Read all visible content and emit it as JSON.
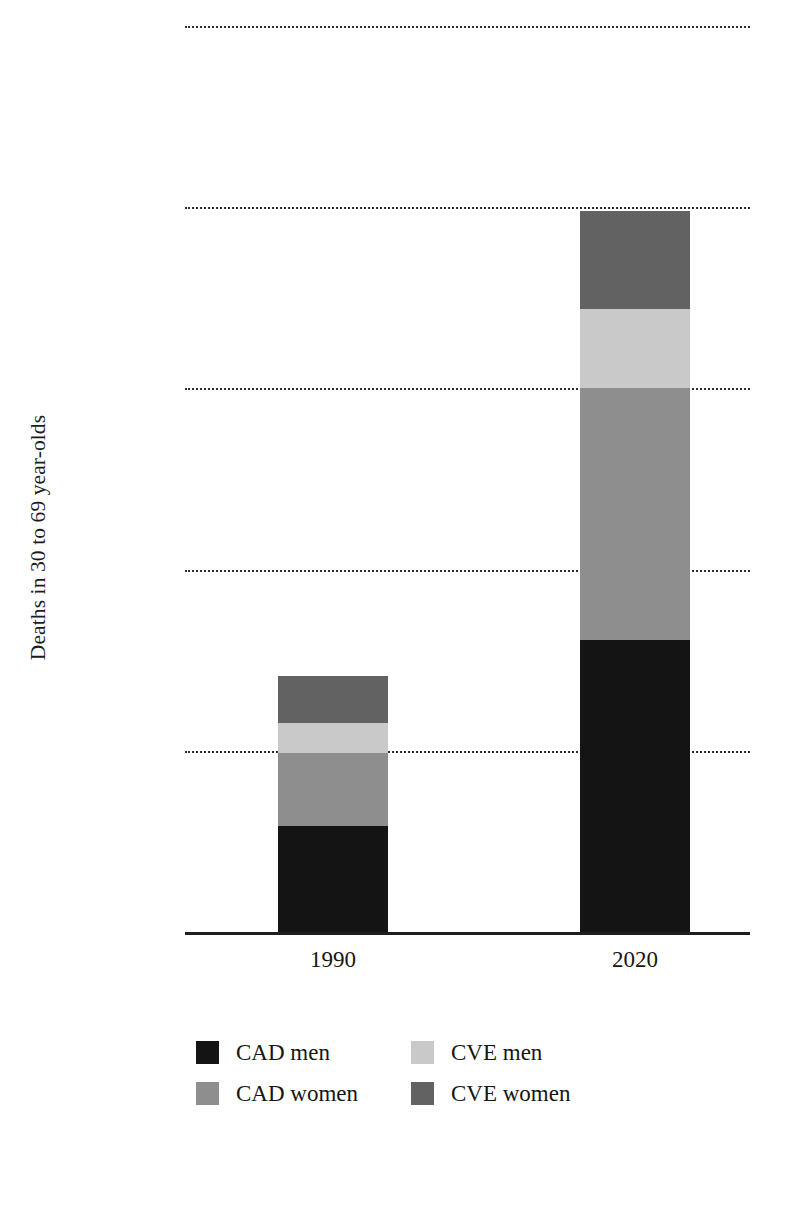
{
  "chart_data": {
    "type": "bar",
    "subtype": "stacked-bar",
    "title": "",
    "xlabel": "",
    "ylabel": "Deaths in 30 to 69 year-olds",
    "categories": [
      "1990",
      "2020"
    ],
    "ylim": [
      0,
      2500000
    ],
    "yticks": [
      0,
      500000,
      1000000,
      1500000,
      2000000,
      2500000
    ],
    "ytick_labels": [
      "0",
      "500000",
      "1000000",
      "1500000",
      "2000000",
      "2500000"
    ],
    "grid": "horizontal-dotted",
    "legend_position": "bottom",
    "stack_order_bottom_to_top": [
      "CAD men",
      "CAD women",
      "CVE men",
      "CVE women"
    ],
    "series": [
      {
        "name": "CAD men",
        "color": "#141414",
        "values": [
          292000,
          807000
        ]
      },
      {
        "name": "CAD women",
        "color": "#8e8e8e",
        "values": [
          203000,
          695000
        ]
      },
      {
        "name": "CVE men",
        "color": "#c9c9c9",
        "values": [
          83000,
          216000
        ]
      },
      {
        "name": "CVE women",
        "color": "#626262",
        "values": [
          128000,
          271000
        ]
      }
    ],
    "totals": [
      706000,
      1989000
    ]
  },
  "axis": {
    "y_title": "Deaths in 30 to 69 year-olds",
    "y_ticks": [
      {
        "label": "2500000",
        "value": 2500000
      },
      {
        "label": "2000000",
        "value": 2000000
      },
      {
        "label": "1500000",
        "value": 1500000
      },
      {
        "label": "1000000",
        "value": 1000000
      },
      {
        "label": "500000",
        "value": 500000
      },
      {
        "label": "0",
        "value": 0
      }
    ],
    "x_ticks": [
      {
        "label": "1990"
      },
      {
        "label": "2020"
      }
    ]
  },
  "legend": {
    "entries": [
      {
        "label": "CAD men",
        "color": "#141414"
      },
      {
        "label": "CVE men",
        "color": "#c9c9c9"
      },
      {
        "label": "CAD women",
        "color": "#8e8e8e"
      },
      {
        "label": "CVE women",
        "color": "#626262"
      }
    ]
  }
}
